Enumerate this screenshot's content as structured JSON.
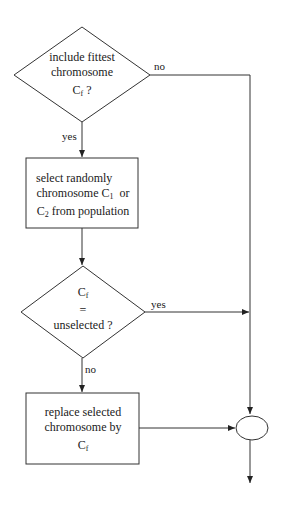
{
  "diagram": {
    "type": "flowchart",
    "nodes": [
      {
        "id": "decision-include-fittest",
        "shape": "diamond",
        "lines": [
          "include fittest",
          "chromosome"
        ],
        "symbol": {
          "base": "C",
          "sub": "f",
          "suffix": " ?"
        }
      },
      {
        "id": "process-select-random",
        "shape": "rectangle",
        "lines": [
          "select randomly",
          "chromosome C",
          "from population"
        ],
        "line2_sub": "1",
        "line2_suffix": "  or",
        "line3_prefix": "C",
        "line3_sub": "2"
      },
      {
        "id": "decision-unselected",
        "shape": "diamond",
        "symbol": {
          "base": "C",
          "sub": "f"
        },
        "eq": "=",
        "tail": "unselected ?"
      },
      {
        "id": "process-replace",
        "shape": "rectangle",
        "lines": [
          "replace selected",
          "chromosome by"
        ],
        "symbol": {
          "base": "C",
          "sub": "f"
        }
      },
      {
        "id": "merge-connector",
        "shape": "ellipse"
      }
    ],
    "edges": [
      {
        "from": "decision-include-fittest",
        "to": "process-select-random",
        "label": "yes"
      },
      {
        "from": "decision-include-fittest",
        "to": "merge-connector",
        "label": "no"
      },
      {
        "from": "process-select-random",
        "to": "decision-unselected",
        "label": ""
      },
      {
        "from": "decision-unselected",
        "to": "merge-connector",
        "label": "yes"
      },
      {
        "from": "decision-unselected",
        "to": "process-replace",
        "label": "no"
      },
      {
        "from": "process-replace",
        "to": "merge-connector",
        "label": ""
      },
      {
        "from": "merge-connector",
        "to": "exit",
        "label": ""
      }
    ],
    "colors": {
      "stroke": "#333333",
      "background": "#ffffff"
    }
  }
}
